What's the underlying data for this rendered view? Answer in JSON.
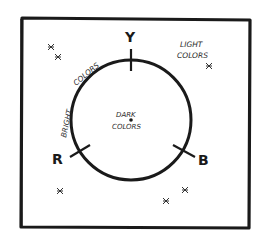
{
  "diagram": {
    "type": "color-wheel-sketch",
    "style": "hand-drawn black ink on white",
    "colors": {
      "ink": "#1a1a1a",
      "background": "#ffffff"
    },
    "axes": {
      "yellow": "Y",
      "red": "R",
      "blue": "B"
    },
    "center": {
      "line1": "DARK",
      "line2": "COLORS"
    },
    "rim_label": {
      "word1": "BRIGHT",
      "word2": "COLORS"
    },
    "outer_label": {
      "line1": "LIGHT",
      "line2": "COLORS"
    },
    "star_marks": 6
  }
}
